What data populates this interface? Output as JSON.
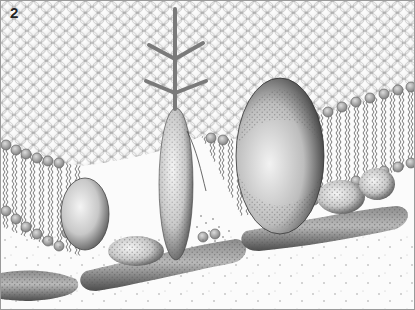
{
  "figure": {
    "panel_label": "2",
    "colors": {
      "background": "#fbfbfb",
      "lipid_head_fill": "#ffffff",
      "lipid_head_stroke": "#9a9a9a",
      "lipid_head_edge": "#b5b5b5",
      "tail": "#555555",
      "protein_light": "#e8e8e8",
      "protein_dark": "#5a5a5a",
      "glycan": "#7a7a7a"
    },
    "components": [
      {
        "name": "phospholipid-bilayer"
      },
      {
        "name": "glycoprotein-with-carbohydrate-chain"
      },
      {
        "name": "large-integral-protein"
      },
      {
        "name": "small-integral-protein"
      },
      {
        "name": "peripheral-proteins"
      },
      {
        "name": "cytoskeletal-filaments"
      }
    ]
  }
}
